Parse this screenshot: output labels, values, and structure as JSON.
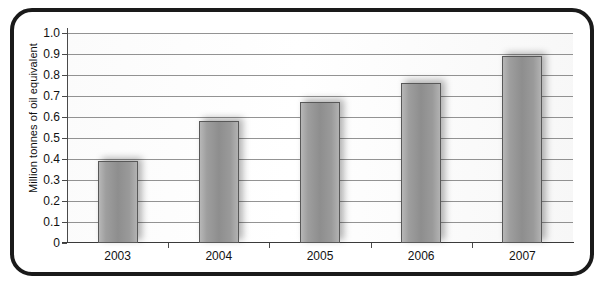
{
  "chart_data": {
    "type": "bar",
    "title": "",
    "subtitle": "",
    "xlabel": "",
    "ylabel": "Million tonnes of oil equivalent",
    "categories": [
      "2003",
      "2004",
      "2005",
      "2006",
      "2007"
    ],
    "values": [
      0.39,
      0.58,
      0.67,
      0.76,
      0.89
    ],
    "series": [
      {
        "name": "Oil equivalent",
        "values": [
          0.39,
          0.58,
          0.67,
          0.76,
          0.89
        ]
      }
    ],
    "ylim": [
      0,
      1.0
    ],
    "y_ticks": [
      "1.0",
      "0.9",
      "0.8",
      "0.7",
      "0.6",
      "0.5",
      "0.4",
      "0.3",
      "0.2",
      "0.1",
      "0"
    ],
    "y_tick_values": [
      1.0,
      0.9,
      0.8,
      0.7,
      0.6,
      0.5,
      0.4,
      0.3,
      0.2,
      0.1,
      0
    ],
    "grid": true,
    "legend": false,
    "legend_position": "none",
    "colors": {
      "bar_fill": "#9e9e9e",
      "bar_edge": "#585858",
      "gridline": "#6f6f6f",
      "axis": "#3a3a3a",
      "text": "#111111",
      "frame_border": "#1a1a1a",
      "plot_background": "#ffffff"
    }
  }
}
